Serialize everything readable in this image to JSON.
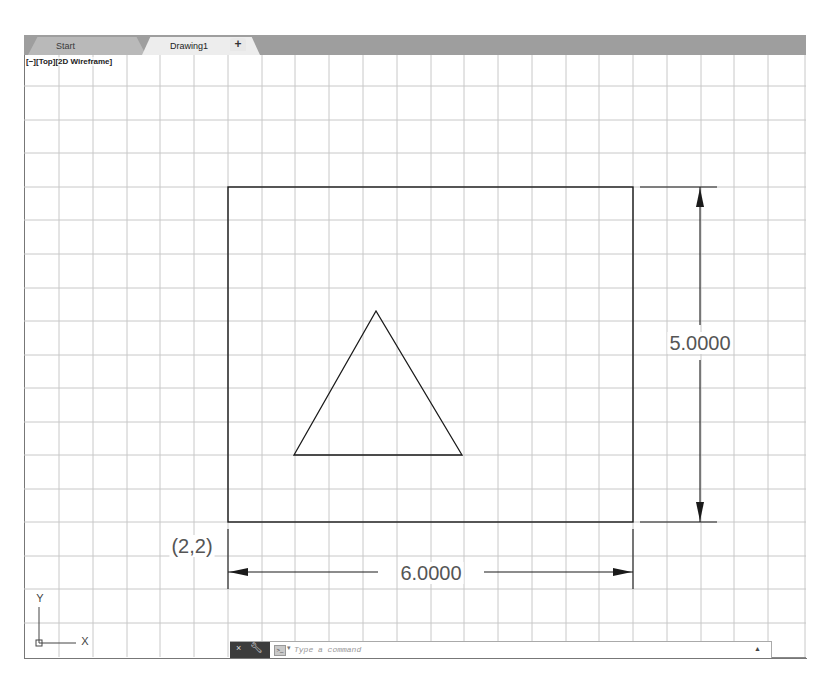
{
  "tabs": [
    {
      "label": "Start",
      "active": false
    },
    {
      "label": "Drawing1",
      "active": true,
      "close_icon": "×"
    }
  ],
  "new_tab": {
    "label": "+",
    "icon": "plus-icon"
  },
  "viewport": {
    "label": "[−][Top][2D Wireframe]",
    "view": "Top",
    "visual_style": "2D Wireframe"
  },
  "drawing": {
    "rectangle": {
      "origin": "(2,2)",
      "width": 6,
      "height": 5
    },
    "triangle": {
      "apex": [
        376,
        311
      ],
      "base_left": [
        294,
        455
      ],
      "base_right": [
        462,
        455
      ]
    },
    "dimensions": {
      "horizontal": "6.0000",
      "vertical": "5.0000"
    },
    "origin_label": "(2,2)"
  },
  "ucs_icon": {
    "x_label": "X",
    "y_label": "Y"
  },
  "command_line": {
    "close_icon": "×",
    "customize_icon": "wrench",
    "prompt_icon": ">_",
    "dropdown": "▾",
    "placeholder": "Type a command",
    "value": "",
    "history_icon": "▲"
  },
  "colors": {
    "tabbar_bg": "#9e9e9e",
    "active_tab_bg": "#ededed",
    "grid_line": "#c8c8c8",
    "geometry": "#1a1a1a",
    "dimension_text": "#555555",
    "cmd_dark": "#3c3c3c"
  }
}
